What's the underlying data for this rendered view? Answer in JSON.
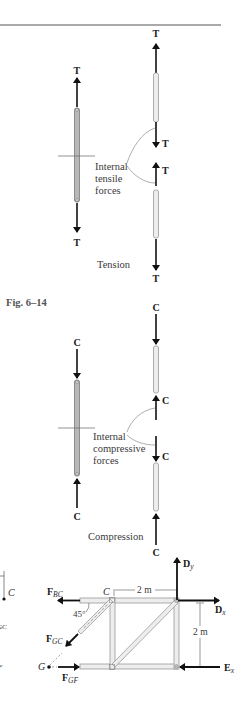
{
  "figure": {
    "caption": "Fig. 6–14",
    "colors": {
      "ink": "#1a1a1a",
      "member_fill_dark": "#b8b8b8",
      "member_fill_light": "#ededed",
      "member_stroke": "#8a8a8a",
      "rule": "#555555"
    }
  },
  "tension": {
    "force_symbol": "T",
    "internal_label_lines": [
      "Internal",
      "tensile",
      "forces"
    ],
    "title": "Tension"
  },
  "compression": {
    "force_symbol": "C",
    "internal_label_lines": [
      "Internal",
      "compressive",
      "forces"
    ],
    "title": "Compression"
  },
  "truss": {
    "node_c_label": "C",
    "node_g_label": "G",
    "angle_label": "45°",
    "width_dim": "2 m",
    "height_dim": "2 m",
    "forces": {
      "f_bc": {
        "main": "F",
        "sub": "BC"
      },
      "f_gc": {
        "main": "F",
        "sub": "GC"
      },
      "f_gf": {
        "main": "F",
        "sub": "GF"
      },
      "d_y": {
        "main": "D",
        "sub": "y"
      },
      "d_x": {
        "main": "D",
        "sub": "x"
      },
      "e_x": {
        "main": "E",
        "sub": "x"
      }
    },
    "left_fragment": {
      "node_label": "C",
      "sub_gc": "GC",
      "sub_f": "F"
    }
  }
}
